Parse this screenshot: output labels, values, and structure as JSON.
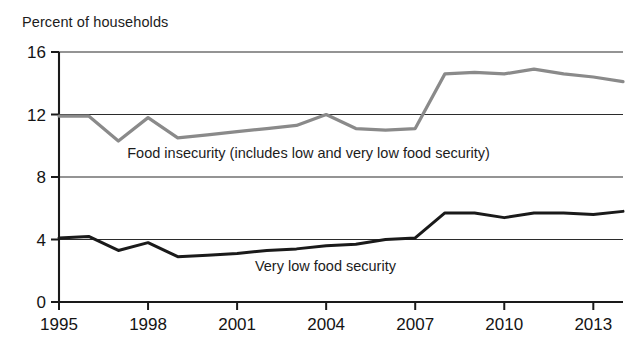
{
  "chart_data": {
    "type": "line",
    "title": "",
    "ylabel": "Percent of households",
    "xlabel": "",
    "ylim": [
      0,
      16
    ],
    "xlim": [
      1995,
      2014
    ],
    "yticks": [
      "0",
      "4",
      "8",
      "12",
      "16"
    ],
    "ytick_values": [
      0,
      4,
      8,
      12,
      16
    ],
    "xticks": [
      "1995",
      "1998",
      "2001",
      "2004",
      "2007",
      "2010",
      "2013"
    ],
    "xtick_values": [
      1995,
      1998,
      2001,
      2004,
      2007,
      2010,
      2013
    ],
    "grid": true,
    "legend_position": "inline-annotation",
    "x": [
      1995,
      1996,
      1997,
      1998,
      1999,
      2000,
      2001,
      2002,
      2003,
      2004,
      2005,
      2006,
      2007,
      2008,
      2009,
      2010,
      2011,
      2012,
      2013,
      2014
    ],
    "series": [
      {
        "name": "Food insecurity (includes low and very low food security)",
        "color": "#8a8a8a",
        "label_x": 1997.3,
        "label_y": 9.2,
        "values": [
          11.9,
          11.9,
          10.3,
          11.8,
          10.5,
          10.7,
          10.9,
          11.1,
          11.3,
          12.0,
          11.1,
          11.0,
          11.1,
          14.6,
          14.7,
          14.6,
          14.9,
          14.6,
          14.4,
          14.1
        ]
      },
      {
        "name": "Very low food security",
        "color": "#1a1a1a",
        "label_x": 2001.6,
        "label_y": 2.0,
        "values": [
          4.1,
          4.2,
          3.3,
          3.8,
          2.9,
          3.0,
          3.1,
          3.3,
          3.4,
          3.6,
          3.7,
          4.0,
          4.1,
          5.7,
          5.7,
          5.4,
          5.7,
          5.7,
          5.6,
          5.8
        ]
      }
    ]
  }
}
